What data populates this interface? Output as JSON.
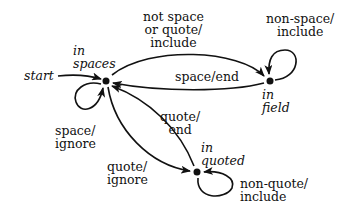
{
  "diagram": {
    "type": "state-machine",
    "colors": {
      "stroke": "#111111",
      "background": "#ffffff"
    },
    "start_label": "start",
    "states": [
      {
        "id": "spaces",
        "label": "in\nspaces",
        "x": 106,
        "y": 81
      },
      {
        "id": "field",
        "label": "in\nfield",
        "x": 270,
        "y": 81
      },
      {
        "id": "quoted",
        "label": "in\nquoted",
        "x": 197,
        "y": 172
      }
    ],
    "transitions": [
      {
        "from": "spaces",
        "to": "field",
        "label": "not space\nor quote/\ninclude"
      },
      {
        "from": "field",
        "to": "spaces",
        "label": "space/end"
      },
      {
        "from": "field",
        "to": "field",
        "label": "non-space/\ninclude"
      },
      {
        "from": "spaces",
        "to": "spaces",
        "label": "space/\nignore"
      },
      {
        "from": "spaces",
        "to": "quoted",
        "label": "quote/\nignore"
      },
      {
        "from": "quoted",
        "to": "spaces",
        "label": "quote/\nend"
      },
      {
        "from": "quoted",
        "to": "quoted",
        "label": "non-quote/\ninclude"
      }
    ]
  }
}
